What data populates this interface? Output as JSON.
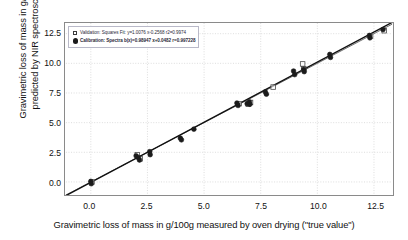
{
  "chart_data": {
    "type": "scatter",
    "title": "",
    "xlabel": "Gravimetric loss of mass in g/100g measured by oven drying (\"true value\")",
    "ylabel_line1": "Gravimetric loss of mass in g/100 g",
    "ylabel_line2": "predicted by NIR spectroscopy",
    "xlim": [
      -1.1,
      13.3
    ],
    "ylim": [
      -1.1,
      13.4
    ],
    "xticks": [
      "0.0",
      "2.5",
      "5.0",
      "7.5",
      "10.0",
      "12.5"
    ],
    "xtick_values": [
      0.0,
      2.5,
      5.0,
      7.5,
      10.0,
      12.5
    ],
    "yticks": [
      "0.0",
      "2.5",
      "5.0",
      "7.5",
      "10.0",
      "12.5"
    ],
    "ytick_values": [
      0.0,
      2.5,
      5.0,
      7.5,
      10.0,
      12.5
    ],
    "grid": true,
    "grid_style": "dotted",
    "grid_color": "#d4d4d4",
    "frame_color": "#8a8a8a",
    "legend_position": "upper left",
    "series": [
      {
        "name": "Validation",
        "marker": "open-square",
        "marker_color": "#ffffff",
        "marker_edge_color": "#4a4a4a",
        "points": [
          [
            2.05,
            2.3
          ],
          [
            2.18,
            1.95
          ],
          [
            6.55,
            6.6
          ],
          [
            6.95,
            6.55
          ],
          [
            7.05,
            6.7
          ],
          [
            9.35,
            9.95
          ],
          [
            9.4,
            9.55
          ],
          [
            12.35,
            12.3
          ],
          [
            12.95,
            12.75
          ],
          [
            8.05,
            8.0
          ],
          [
            0.05,
            0.0
          ]
        ]
      },
      {
        "name": "Calibration",
        "marker": "filled-circle",
        "marker_color": "#1b1b1b",
        "marker_edge_color": "#1b1b1b",
        "points": [
          [
            0.0,
            0.05
          ],
          [
            0.02,
            -0.15
          ],
          [
            2.0,
            2.2
          ],
          [
            2.1,
            2.05
          ],
          [
            2.15,
            1.85
          ],
          [
            2.6,
            2.55
          ],
          [
            2.62,
            2.3
          ],
          [
            3.95,
            3.7
          ],
          [
            4.0,
            3.55
          ],
          [
            4.55,
            4.45
          ],
          [
            6.45,
            6.65
          ],
          [
            6.5,
            6.45
          ],
          [
            6.9,
            6.6
          ],
          [
            7.0,
            6.75
          ],
          [
            7.02,
            6.55
          ],
          [
            7.7,
            7.6
          ],
          [
            7.75,
            7.4
          ],
          [
            8.95,
            9.35
          ],
          [
            9.0,
            9.05
          ],
          [
            9.4,
            9.5
          ],
          [
            9.42,
            9.3
          ],
          [
            10.55,
            10.75
          ],
          [
            10.58,
            10.5
          ],
          [
            12.3,
            12.35
          ],
          [
            12.32,
            12.15
          ],
          [
            12.9,
            12.85
          ]
        ]
      }
    ],
    "lines": [
      {
        "name": "identity-line",
        "from": [
          -1.1,
          -1.1
        ],
        "to": [
          13.3,
          13.3
        ],
        "color": "#6f6f6f",
        "width": 1
      },
      {
        "name": "regression-line",
        "from": [
          -1.1,
          -1.15
        ],
        "to": [
          13.3,
          13.45
        ],
        "color": "#101010",
        "width": 1.4
      }
    ]
  },
  "legend": {
    "items": [
      {
        "marker": "open-square",
        "label": "Validation: Squares Fit: y=1.0076 x-0.2568  r2=0.9974"
      },
      {
        "marker": "filled-circle",
        "label": "Calibration: Spectra  b(x)=0.98947 x+0.0482   r=0.997228"
      }
    ]
  }
}
